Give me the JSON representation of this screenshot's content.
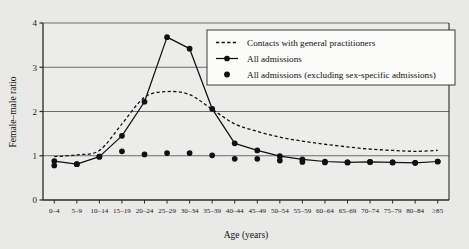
{
  "chart_data": {
    "type": "line",
    "title": "",
    "xlabel": "Age (years)",
    "ylabel": "Female–male ratio",
    "ylim": [
      0,
      4
    ],
    "yticks": [
      0,
      1,
      2,
      3,
      4
    ],
    "grid": true,
    "legend_position": "top-right",
    "categories": [
      "0–4",
      "5–9",
      "10–14",
      "15–19",
      "20–24",
      "25–29",
      "30–34",
      "35–39",
      "40–44",
      "45–49",
      "50–54",
      "55–59",
      "60–64",
      "65–69",
      "70–74",
      "75–79",
      "80–84",
      "≥85"
    ],
    "series": [
      {
        "name": "Contacts with general practitioners",
        "style": "dashed",
        "marker": "none",
        "values": [
          0.98,
          1.02,
          1.12,
          1.72,
          2.32,
          2.45,
          2.38,
          2.05,
          1.72,
          1.55,
          1.42,
          1.33,
          1.26,
          1.2,
          1.15,
          1.12,
          1.1,
          1.12
        ]
      },
      {
        "name": "All admissions",
        "style": "solid",
        "marker": "filled-circle",
        "values": [
          0.88,
          0.81,
          0.98,
          1.45,
          2.22,
          3.68,
          3.42,
          2.06,
          1.28,
          1.12,
          0.99,
          0.92,
          0.87,
          0.85,
          0.86,
          0.85,
          0.84,
          0.87
        ]
      },
      {
        "name": "All admissions (excluding sex-specific admissions)",
        "style": "none",
        "marker": "filled-circle",
        "values": [
          0.78,
          0.81,
          0.98,
          1.1,
          1.03,
          1.06,
          1.06,
          1.01,
          0.93,
          0.93,
          0.89,
          0.86,
          0.85,
          0.85,
          0.86,
          0.85,
          0.84,
          0.87
        ]
      }
    ]
  },
  "legend": {
    "entries": [
      {
        "label": "Contacts with general practitioners",
        "swatch": "dashed-line"
      },
      {
        "label": "All admissions",
        "swatch": "line-with-dot"
      },
      {
        "label": "All admissions (excluding sex-specific admissions)",
        "swatch": "dot-only"
      }
    ]
  },
  "colors": {
    "background": "#e9e9e7",
    "plot_background": "#ececeb",
    "axis": "#2a2a2a",
    "grid": "#6d6d6d",
    "series": "#111111",
    "legend_background": "#fbfbfa"
  }
}
